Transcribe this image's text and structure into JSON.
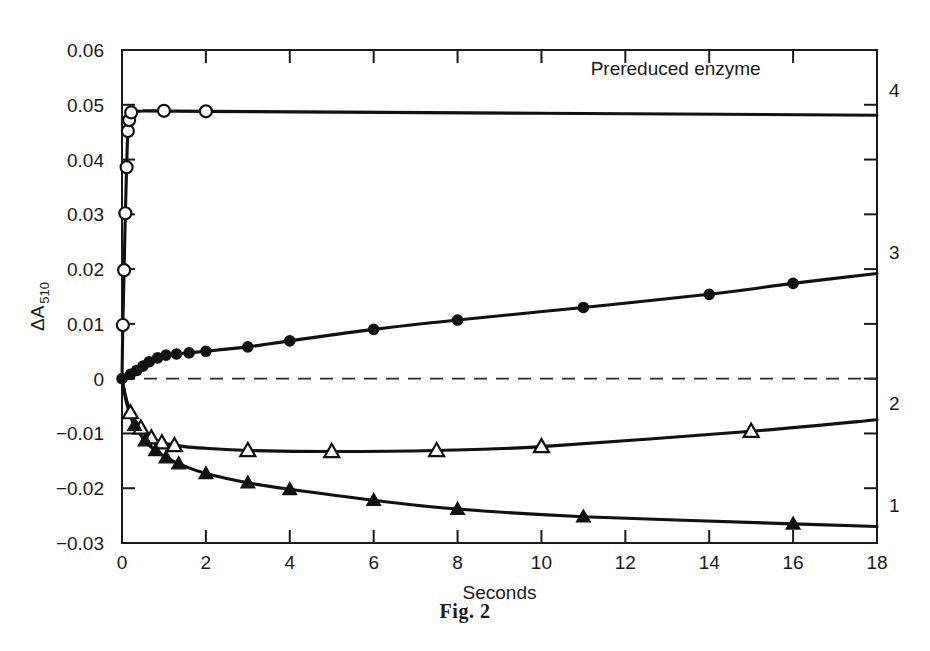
{
  "figure": {
    "caption": "Fig. 2",
    "background_color": "#ffffff",
    "ink_color": "#111111"
  },
  "chart_data": {
    "type": "line",
    "title": "",
    "xlabel": "Seconds",
    "ylabel": "ΔA",
    "ylabel_subscript": "510",
    "xlim": [
      0,
      18
    ],
    "ylim": [
      -0.03,
      0.06
    ],
    "grid": false,
    "legend_position": "none",
    "xticks": [
      0,
      2,
      4,
      6,
      8,
      10,
      12,
      14,
      16,
      18
    ],
    "xtick_labels": [
      "0",
      "2",
      "4",
      "6",
      "8",
      "10",
      "12",
      "14",
      "16",
      "18"
    ],
    "yticks": [
      -0.03,
      -0.02,
      -0.01,
      0,
      0.01,
      0.02,
      0.03,
      0.04,
      0.05,
      0.06
    ],
    "ytick_labels": [
      "−0.03",
      "−0.02",
      "−0.01",
      "0",
      "0.01",
      "0.02",
      "0.03",
      "0.04",
      "0.05",
      "0.06"
    ],
    "annotations": [
      {
        "text": "Prereduced enzyme",
        "x": 13.2,
        "y": 0.0555
      }
    ],
    "reference_lines": [
      {
        "y": 0,
        "style": "dashed",
        "label": "zero-line"
      }
    ],
    "series": [
      {
        "name": "4",
        "label": "4",
        "label_x": 18,
        "label_y": 0.0515,
        "marker": "open-circle",
        "points": [
          [
            0.0,
            0.0
          ],
          [
            0.02,
            0.0098
          ],
          [
            0.05,
            0.0198
          ],
          [
            0.08,
            0.0302
          ],
          [
            0.11,
            0.0386
          ],
          [
            0.14,
            0.0452
          ],
          [
            0.17,
            0.0472
          ],
          [
            0.2,
            0.0482
          ],
          [
            0.3,
            0.0488
          ],
          [
            1.0,
            0.0489
          ],
          [
            2.0,
            0.0488
          ],
          [
            18.0,
            0.0481
          ]
        ],
        "marker_points": [
          [
            0.02,
            0.0098
          ],
          [
            0.05,
            0.0198
          ],
          [
            0.08,
            0.0302
          ],
          [
            0.11,
            0.0386
          ],
          [
            0.14,
            0.0452
          ],
          [
            0.17,
            0.0472
          ],
          [
            0.22,
            0.0486
          ],
          [
            1.0,
            0.0489
          ],
          [
            2.0,
            0.0488
          ]
        ]
      },
      {
        "name": "3",
        "label": "3",
        "label_x": 18,
        "label_y": 0.0218,
        "marker": "filled-circle",
        "points": [
          [
            0.0,
            0.0
          ],
          [
            0.15,
            0.0006
          ],
          [
            0.3,
            0.0012
          ],
          [
            0.45,
            0.0021
          ],
          [
            0.6,
            0.0029
          ],
          [
            0.75,
            0.0035
          ],
          [
            0.95,
            0.0041
          ],
          [
            1.15,
            0.0044
          ],
          [
            1.4,
            0.0046
          ],
          [
            1.7,
            0.0048
          ],
          [
            2.0,
            0.005
          ],
          [
            3.0,
            0.0058
          ],
          [
            4.0,
            0.0069
          ],
          [
            6.0,
            0.009
          ],
          [
            8.0,
            0.0107
          ],
          [
            11.0,
            0.013
          ],
          [
            14.0,
            0.0154
          ],
          [
            16.0,
            0.0174
          ],
          [
            18.0,
            0.0192
          ]
        ],
        "marker_points": [
          [
            0.0,
            0.0
          ],
          [
            0.2,
            0.0008
          ],
          [
            0.35,
            0.0015
          ],
          [
            0.5,
            0.0023
          ],
          [
            0.65,
            0.0031
          ],
          [
            0.85,
            0.0038
          ],
          [
            1.05,
            0.0043
          ],
          [
            1.3,
            0.0045
          ],
          [
            1.6,
            0.0047
          ],
          [
            2.0,
            0.005
          ],
          [
            3.0,
            0.0058
          ],
          [
            4.0,
            0.0069
          ],
          [
            6.0,
            0.009
          ],
          [
            8.0,
            0.0107
          ],
          [
            11.0,
            0.013
          ],
          [
            14.0,
            0.0154
          ],
          [
            16.0,
            0.0174
          ]
        ]
      },
      {
        "name": "2",
        "label": "2",
        "label_x": 18,
        "label_y": -0.0058,
        "marker": "open-triangle",
        "points": [
          [
            0.0,
            0.0
          ],
          [
            0.08,
            -0.003
          ],
          [
            0.18,
            -0.0058
          ],
          [
            0.3,
            -0.0075
          ],
          [
            0.45,
            -0.009
          ],
          [
            0.6,
            -0.0102
          ],
          [
            0.8,
            -0.0112
          ],
          [
            1.0,
            -0.0118
          ],
          [
            1.5,
            -0.0124
          ],
          [
            2.0,
            -0.0127
          ],
          [
            3.0,
            -0.0131
          ],
          [
            5.0,
            -0.0133
          ],
          [
            7.5,
            -0.0131
          ],
          [
            10.0,
            -0.0124
          ],
          [
            15.0,
            -0.0096
          ],
          [
            18.0,
            -0.0075
          ]
        ],
        "marker_points": [
          [
            0.2,
            -0.0062
          ],
          [
            0.45,
            -0.009
          ],
          [
            0.7,
            -0.0108
          ],
          [
            0.95,
            -0.0117
          ],
          [
            1.25,
            -0.0122
          ],
          [
            3.0,
            -0.0131
          ],
          [
            5.0,
            -0.0133
          ],
          [
            7.5,
            -0.0131
          ],
          [
            10.0,
            -0.0124
          ],
          [
            15.0,
            -0.0096
          ]
        ]
      },
      {
        "name": "1",
        "label": "1",
        "label_x": 18,
        "label_y": -0.0243,
        "marker": "filled-triangle",
        "points": [
          [
            0.0,
            0.0
          ],
          [
            0.1,
            -0.0042
          ],
          [
            0.25,
            -0.0078
          ],
          [
            0.4,
            -0.0098
          ],
          [
            0.6,
            -0.0118
          ],
          [
            0.85,
            -0.0134
          ],
          [
            1.1,
            -0.0146
          ],
          [
            1.5,
            -0.016
          ],
          [
            2.0,
            -0.0173
          ],
          [
            3.0,
            -0.019
          ],
          [
            4.0,
            -0.0202
          ],
          [
            6.0,
            -0.0222
          ],
          [
            8.0,
            -0.0238
          ],
          [
            11.0,
            -0.0252
          ],
          [
            16.0,
            -0.0265
          ],
          [
            18.0,
            -0.027
          ]
        ],
        "marker_points": [
          [
            0.3,
            -0.0085
          ],
          [
            0.55,
            -0.0113
          ],
          [
            0.8,
            -0.0131
          ],
          [
            1.05,
            -0.0144
          ],
          [
            1.35,
            -0.0155
          ],
          [
            2.0,
            -0.0173
          ],
          [
            3.0,
            -0.019
          ],
          [
            4.0,
            -0.0202
          ],
          [
            6.0,
            -0.0222
          ],
          [
            8.0,
            -0.0238
          ],
          [
            11.0,
            -0.0252
          ],
          [
            16.0,
            -0.0265
          ]
        ]
      }
    ]
  }
}
